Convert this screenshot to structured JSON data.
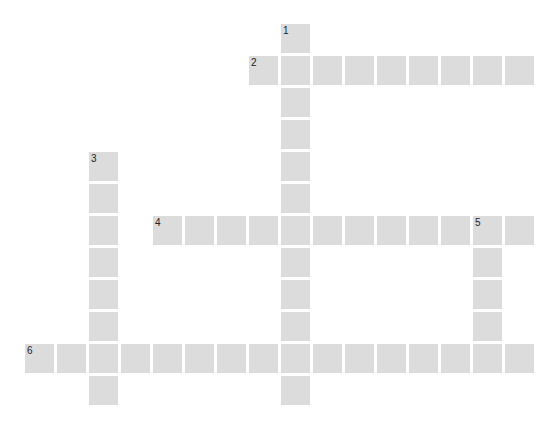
{
  "puzzle": {
    "type": "crossword",
    "grid": {
      "origin_x": 25,
      "origin_y": 24,
      "pitch": 32,
      "cell_size": 29,
      "cols": 16,
      "rows": 12
    },
    "cell_color": "#dcdcdc",
    "number_color": "#222222",
    "entries": [
      {
        "number": "1",
        "direction": "down",
        "row": 0,
        "col": 8,
        "length": 12
      },
      {
        "number": "2",
        "direction": "across",
        "row": 1,
        "col": 7,
        "length": 9
      },
      {
        "number": "3",
        "direction": "down",
        "row": 4,
        "col": 2,
        "length": 8
      },
      {
        "number": "4",
        "direction": "across",
        "row": 6,
        "col": 4,
        "length": 12
      },
      {
        "number": "5",
        "direction": "down",
        "row": 6,
        "col": 14,
        "length": 5
      },
      {
        "number": "6",
        "direction": "across",
        "row": 10,
        "col": 0,
        "length": 16
      }
    ]
  }
}
